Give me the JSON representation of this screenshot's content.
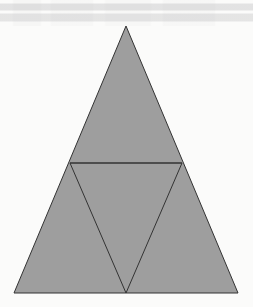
{
  "figure": {
    "background_color": "#fbfbfa",
    "fill_color": "#9e9e9e",
    "stroke_color": "#333333",
    "stroke_width": 1,
    "canvas": {
      "width": 253,
      "height": 307
    }
  },
  "shapes": {
    "outer_triangle": {
      "name": "outer-triangle",
      "points": "126,26 238,293 14,293",
      "vertices": [
        {
          "label": "apex",
          "x": 126,
          "y": 26
        },
        {
          "label": "bottom-right",
          "x": 238,
          "y": 293
        },
        {
          "label": "bottom-left",
          "x": 14,
          "y": 293
        }
      ]
    },
    "inner_triangle": {
      "name": "inner-inverted-triangle",
      "points": "70,163 182,163 126,293",
      "vertices": [
        {
          "label": "left-midpoint",
          "x": 70,
          "y": 163
        },
        {
          "label": "right-midpoint",
          "x": 182,
          "y": 163
        },
        {
          "label": "base-midpoint",
          "x": 126,
          "y": 293
        }
      ]
    },
    "midline": {
      "name": "horizontal-midline",
      "x1": 70,
      "y1": 163,
      "x2": 182,
      "y2": 163
    }
  }
}
